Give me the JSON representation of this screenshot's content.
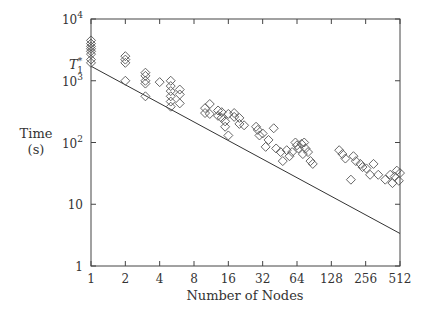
{
  "chart_data": {
    "type": "scatter",
    "title": "",
    "xlabel": "Number of Nodes",
    "ylabel": "Time (s)",
    "ylabel_lines": [
      "Time",
      "(s)"
    ],
    "xscale": "log2",
    "yscale": "log10",
    "xlim": [
      1,
      512
    ],
    "ylim": [
      1,
      10000
    ],
    "grid": false,
    "legend": null,
    "x_ticks": [
      1,
      2,
      4,
      8,
      16,
      32,
      64,
      128,
      256,
      512
    ],
    "x_tick_labels": [
      "1",
      "2",
      "4",
      "8",
      "16",
      "32",
      "64",
      "128",
      "256",
      "512"
    ],
    "y_ticks": [
      1,
      10,
      100,
      1000,
      10000
    ],
    "y_tick_labels": [
      {
        "base": "1",
        "exp": ""
      },
      {
        "base": "10",
        "exp": ""
      },
      {
        "base": "10",
        "exp": "2"
      },
      {
        "base": "10",
        "exp": "3"
      },
      {
        "base": "10",
        "exp": "4"
      }
    ],
    "annotations": [
      {
        "text": "T",
        "sub": "1",
        "sup": "*",
        "y": 1720
      }
    ],
    "series": [
      {
        "name": "Measured runs",
        "marker": "diamond",
        "points": [
          [
            1,
            4500
          ],
          [
            1,
            4000
          ],
          [
            1,
            3600
          ],
          [
            1,
            3300
          ],
          [
            1,
            3000
          ],
          [
            1,
            2700
          ],
          [
            1,
            2200
          ],
          [
            1,
            1950
          ],
          [
            2,
            2500
          ],
          [
            2,
            2200
          ],
          [
            2,
            1950
          ],
          [
            2,
            1000
          ],
          [
            3,
            1350
          ],
          [
            3,
            1200
          ],
          [
            3,
            1000
          ],
          [
            3,
            900
          ],
          [
            3,
            560
          ],
          [
            4,
            950
          ],
          [
            5,
            1000
          ],
          [
            5,
            820
          ],
          [
            5,
            680
          ],
          [
            5,
            560
          ],
          [
            5,
            460
          ],
          [
            5,
            380
          ],
          [
            6,
            720
          ],
          [
            6,
            600
          ],
          [
            6,
            430
          ],
          [
            10,
            360
          ],
          [
            10,
            300
          ],
          [
            11,
            420
          ],
          [
            11,
            290
          ],
          [
            13,
            330
          ],
          [
            13,
            270
          ],
          [
            14,
            310
          ],
          [
            14,
            250
          ],
          [
            15,
            220
          ],
          [
            15,
            180
          ],
          [
            16,
            290
          ],
          [
            16,
            130
          ],
          [
            18,
            300
          ],
          [
            18,
            260
          ],
          [
            20,
            250
          ],
          [
            20,
            200
          ],
          [
            22,
            190
          ],
          [
            28,
            180
          ],
          [
            29,
            160
          ],
          [
            30,
            130
          ],
          [
            32,
            140
          ],
          [
            34,
            85
          ],
          [
            36,
            110
          ],
          [
            40,
            170
          ],
          [
            42,
            80
          ],
          [
            46,
            70
          ],
          [
            48,
            50
          ],
          [
            52,
            75
          ],
          [
            55,
            60
          ],
          [
            58,
            70
          ],
          [
            62,
            100
          ],
          [
            64,
            90
          ],
          [
            66,
            80
          ],
          [
            70,
            95
          ],
          [
            72,
            65
          ],
          [
            74,
            100
          ],
          [
            76,
            80
          ],
          [
            80,
            70
          ],
          [
            84,
            50
          ],
          [
            88,
            45
          ],
          [
            150,
            75
          ],
          [
            160,
            65
          ],
          [
            170,
            55
          ],
          [
            190,
            25
          ],
          [
            200,
            60
          ],
          [
            210,
            50
          ],
          [
            230,
            45
          ],
          [
            240,
            40
          ],
          [
            260,
            38
          ],
          [
            280,
            30
          ],
          [
            300,
            45
          ],
          [
            330,
            30
          ],
          [
            380,
            25
          ],
          [
            420,
            30
          ],
          [
            440,
            22
          ],
          [
            460,
            28
          ],
          [
            480,
            35
          ],
          [
            500,
            24
          ],
          [
            512,
            32
          ]
        ]
      },
      {
        "name": "Linear speedup",
        "type": "line",
        "points": [
          [
            1,
            1720
          ],
          [
            512,
            3.36
          ]
        ]
      }
    ]
  },
  "colors": {
    "axis": "#444444",
    "marker": "#555555",
    "line": "#333333"
  }
}
